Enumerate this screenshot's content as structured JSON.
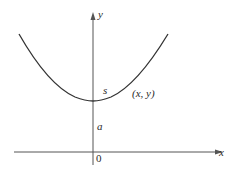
{
  "figure": {
    "colors": {
      "axis": "#555555",
      "curve": "#333333",
      "text": "#2a2a2a",
      "background": "#ffffff"
    },
    "axes": {
      "x_label": "x",
      "y_label": "y",
      "origin_label": "0"
    },
    "curve": {
      "type": "catenary",
      "vertex_label": "a",
      "arc_label": "s",
      "point_label": "(x, y)"
    }
  }
}
